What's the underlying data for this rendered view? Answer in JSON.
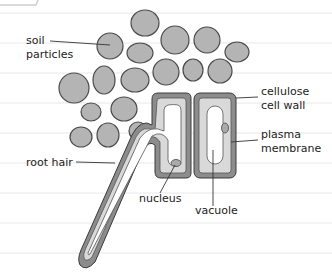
{
  "diagram": {
    "colors": {
      "background": "#ffffff",
      "ruled_line": "#e6e6e6",
      "soil_fill": "#b4b4b4",
      "soil_stroke": "#4a4a4a",
      "cell_wall": "#8c8c8c",
      "cell_wall_stroke": "#3a3a3a",
      "cytoplasm": "#d9d9d9",
      "vacuole": "#ffffff",
      "leader_line": "#333333",
      "text": "#222222"
    },
    "labels": {
      "soil_line1": "soil",
      "soil_line2": "particles",
      "root_hair": "root hair",
      "nucleus": "nucleus",
      "vacuole": "vacuole",
      "cell_wall_line1": "cellulose",
      "cell_wall_line2": "cell wall",
      "membrane_line1": "plasma",
      "membrane_line2": "membrane"
    },
    "structures": [
      "soil particles",
      "root hair cell",
      "neighbouring cell",
      "cellulose cell wall",
      "plasma membrane",
      "nucleus",
      "vacuole",
      "root hair"
    ]
  }
}
